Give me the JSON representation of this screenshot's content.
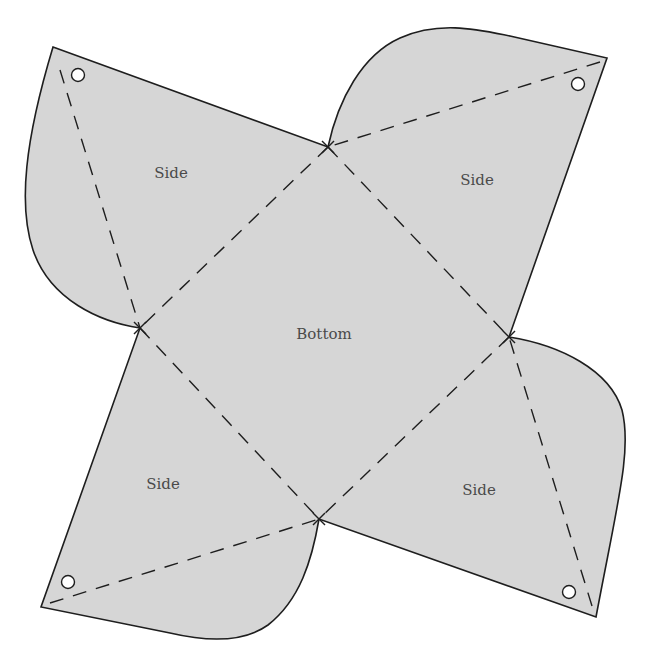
{
  "diagram": {
    "type": "box-net-template",
    "colors": {
      "fill": "#d6d6d6",
      "stroke": "#1e1e1e",
      "label": "#4a4a4a",
      "hole": "#ffffff",
      "background": "#ffffff"
    },
    "labels": {
      "bottom": "Bottom",
      "side_top_left": "Side",
      "side_top_right": "Side",
      "side_bottom_left": "Side",
      "side_bottom_right": "Side"
    },
    "panels": [
      {
        "id": "bottom",
        "label": "Bottom"
      },
      {
        "id": "side-top-left",
        "label": "Side"
      },
      {
        "id": "side-top-right",
        "label": "Side"
      },
      {
        "id": "side-bottom-left",
        "label": "Side"
      },
      {
        "id": "side-bottom-right",
        "label": "Side"
      }
    ],
    "fold_lines": "dashed",
    "punch_holes": 4
  }
}
